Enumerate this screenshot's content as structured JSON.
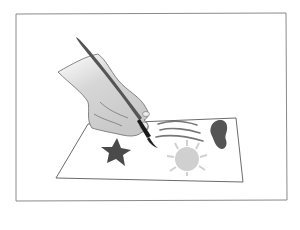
{
  "illustration": {
    "subject": "hand painting on paper with a brush",
    "elements": [
      "frame",
      "paper-sheet",
      "hand",
      "paintbrush",
      "star",
      "heart",
      "sun",
      "brush-strokes"
    ],
    "colors": {
      "background": "#ffffff",
      "frame_border": "#8a8a8a",
      "paper_outline": "#5a5a5a",
      "hand_fill": "#cfcfcf",
      "hand_outline": "#6a6a6a",
      "brush_handle": "#555555",
      "brush_ferrule": "#1a1a1a",
      "star_fill": "#4a4a4a",
      "heart_fill": "#555555",
      "sun_fill": "#d0d0d0",
      "stroke_lines": "#777777"
    }
  }
}
